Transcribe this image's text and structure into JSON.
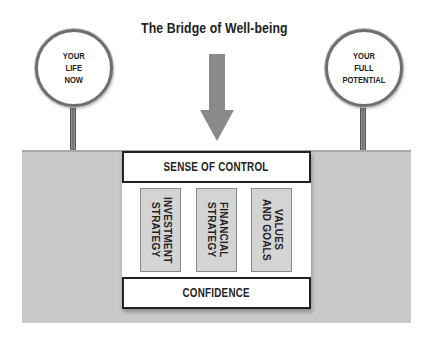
{
  "title": "The Bridge of Well-being",
  "signs": {
    "left": {
      "text": "YOUR\nLIFE\nNOW"
    },
    "right": {
      "text": "YOUR\nFULL\nPOTENTIAL"
    }
  },
  "arrow": {
    "icon": "down-arrow-icon",
    "color": "#8a8a8a"
  },
  "bridge": {
    "top_bar": "SENSE OF CONTROL",
    "pillars": [
      {
        "label": "INVESTMENT\nSTRATEGY"
      },
      {
        "label": "FINANCIAL\nSTRATEGY"
      },
      {
        "label": "VALUES\nAND GOALS"
      }
    ],
    "bottom_bar": "CONFIDENCE"
  },
  "colors": {
    "ground": "#c9c9c9",
    "pillar_fill": "#d4d4d4",
    "outline": "#222222",
    "pole": "#7a7a7a"
  }
}
